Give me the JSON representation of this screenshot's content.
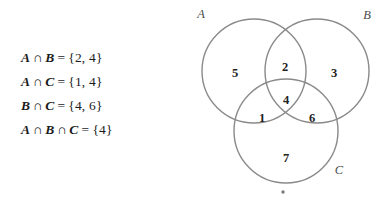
{
  "equations": [
    {
      "id": "a-intersect-b",
      "left_set": "A",
      "operator1": "∩",
      "mid_set": "B",
      "equals": "=",
      "result": "{2, 4}",
      "text": "A ∩ B = {2, 4}"
    },
    {
      "id": "a-intersect-c",
      "left_set": "A",
      "operator1": "∩",
      "mid_set": "C",
      "equals": "=",
      "result": "{1, 4}",
      "text": "A ∩ C = {1, 4}"
    },
    {
      "id": "b-intersect-c",
      "left_set": "B",
      "operator1": "∩",
      "mid_set": "C",
      "equals": "=",
      "result": "{4, 6}",
      "text": "B ∩ C = {4, 6}"
    },
    {
      "id": "a-intersect-b-intersect-c",
      "left_set": "A",
      "operator1": "∩",
      "mid_set": "B",
      "operator2": "∩",
      "right_set": "C",
      "equals": "=",
      "result": "{4}",
      "text": "A ∩ B ∩ C = {4}"
    }
  ],
  "venn": {
    "set_labels": {
      "a": "A",
      "b": "B",
      "c": "C"
    },
    "regions": [
      {
        "id": "a-only",
        "value": "5",
        "x": 45,
        "y": 72
      },
      {
        "id": "a-and-b",
        "value": "2",
        "x": 95,
        "y": 67
      },
      {
        "id": "b-only",
        "value": "3",
        "x": 144,
        "y": 72
      },
      {
        "id": "a-and-c",
        "value": "1",
        "x": 72,
        "y": 118
      },
      {
        "id": "a-b-and-c",
        "value": "4",
        "x": 96,
        "y": 100
      },
      {
        "id": "b-and-c",
        "value": "6",
        "x": 122,
        "y": 118
      },
      {
        "id": "c-only",
        "value": "7",
        "x": 96,
        "y": 157
      }
    ],
    "colors": {
      "circle_stroke": "#8a8a8a",
      "number_fill": "#222222",
      "label_fill": "#4a4a4a",
      "dot_fill": "#7a7a7a",
      "background": "#ffffff"
    },
    "dot_marker": "•"
  }
}
